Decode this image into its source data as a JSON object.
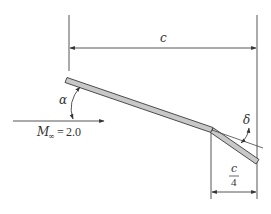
{
  "diagram": {
    "type": "airfoil-flat-plate-with-flap",
    "colors": {
      "line": "#444444",
      "plate_fill": "#c8c8c8",
      "plate_stroke": "#3a3a3a",
      "text": "#333333",
      "background": "#ffffff"
    },
    "labels": {
      "chord": "c",
      "flap_chord_numerator": "c",
      "flap_chord_denominator": "4",
      "angle_of_attack": "α",
      "flap_deflection": "δ",
      "mach_symbol": "M",
      "mach_subscript": "∞",
      "mach_equals": "=",
      "mach_value": "2.0"
    },
    "elements": {
      "plate": {
        "start": [
          67,
          80
        ],
        "hinge": [
          212,
          130
        ]
      },
      "flap": {
        "hinge": [
          212,
          130
        ],
        "end": [
          257,
          162
        ]
      },
      "freestream_arrow": {
        "from": [
          13,
          121
        ],
        "to": [
          105,
          121
        ]
      },
      "chord_dimension": {
        "left_x": 69,
        "right_x": 257,
        "y": 48
      },
      "flap_dimension": {
        "left_x": 211,
        "right_x": 257,
        "y": 192
      }
    }
  }
}
